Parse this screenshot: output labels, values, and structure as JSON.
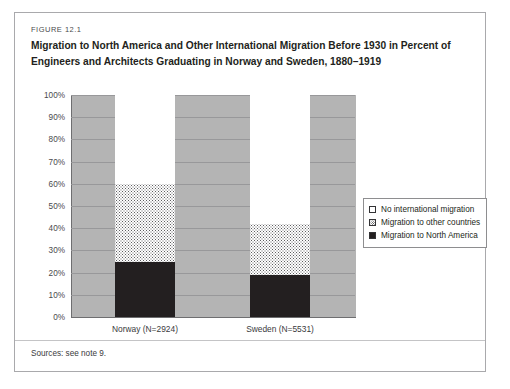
{
  "figure": {
    "number_label": "FIGURE 12.1",
    "title": "Migration to North America and Other International Migration Before 1930 in Percent of Engineers and Architects Graduating in Norway and Sweden, 1880–1919",
    "sources_note": "Sources: see note 9."
  },
  "chart_data": {
    "type": "bar",
    "stacked": true,
    "title": "Migration to North America and Other International Migration Before 1930 in Percent of Engineers and Architects Graduating in Norway and Sweden, 1880–1919",
    "xlabel": "",
    "ylabel": "",
    "categories": [
      "Norway (N=2924)",
      "Sweden (N=5531)"
    ],
    "ylim": [
      0,
      100
    ],
    "yticks": [
      "0%",
      "10%",
      "20%",
      "30%",
      "40%",
      "50%",
      "60%",
      "70%",
      "80%",
      "90%",
      "100%"
    ],
    "ytick_values": [
      0,
      10,
      20,
      30,
      40,
      50,
      60,
      70,
      80,
      90,
      100
    ],
    "grid": true,
    "legend_position": "right",
    "series": [
      {
        "name": "No international migration",
        "values": [
          40,
          58
        ],
        "color": "#ffffff",
        "pattern": "solid"
      },
      {
        "name": "Migration to other countries",
        "values": [
          35,
          23
        ],
        "color": "#ffffff",
        "pattern": "dotted"
      },
      {
        "name": "Migration to North America",
        "values": [
          25,
          19
        ],
        "color": "#231f20",
        "pattern": "solid"
      }
    ],
    "cumulative_tops": {
      "Norway (N=2924)": {
        "north_america": 25,
        "other_countries": 60,
        "none": 100
      },
      "Sweden (N=5531)": {
        "north_america": 19,
        "other_countries": 42,
        "none": 100
      }
    },
    "plot_background": "#b4b4b4"
  },
  "legend": {
    "items": [
      {
        "label": "No international migration",
        "swatch": "white-square-icon"
      },
      {
        "label": "Migration to other countries",
        "swatch": "dotted-square-icon"
      },
      {
        "label": "Migration to North America",
        "swatch": "black-square-icon"
      }
    ]
  }
}
